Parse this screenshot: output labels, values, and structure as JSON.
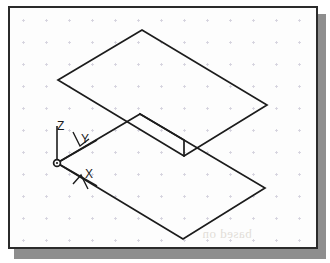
{
  "figure": {
    "name": "isometric-sketch",
    "caption_visible": false,
    "background_color": "#fdfdfd",
    "border_color": "#2b2b2b",
    "shadow_color": "#8e8e8e",
    "line_color": "#1c1c1c",
    "grid_color": "#d8d5e0"
  },
  "grid": {
    "type": "dot-cross",
    "spacing_x": 23,
    "spacing_y": 22,
    "offset_x": 12,
    "offset_y": 11,
    "mark_size": 3
  },
  "axis_indicator": {
    "origin": {
      "x": 47,
      "y": 155
    },
    "origin_marker": "circle",
    "labels": [
      {
        "id": "z-axis-label",
        "text": "Z",
        "x": 47,
        "y": 112
      },
      {
        "id": "y-axis-label",
        "text": "Y",
        "x": 71,
        "y": 125
      },
      {
        "id": "x-axis-label",
        "text": "X",
        "x": 75,
        "y": 160
      }
    ],
    "arms": [
      {
        "id": "z-axis-arm",
        "from": [
          47,
          155
        ],
        "to": [
          47,
          118
        ]
      },
      {
        "id": "y-axis-arm",
        "from": [
          47,
          155
        ],
        "to": [
          85,
          133
        ]
      },
      {
        "id": "x-axis-arm",
        "from": [
          47,
          155
        ],
        "to": [
          85,
          177
        ]
      }
    ],
    "tick_marks": [
      {
        "id": "y-arrow",
        "points": "74,122 80,136 90,130"
      },
      {
        "id": "x-arrow",
        "points": "74,176 82,168 88,180"
      }
    ]
  },
  "geometry": {
    "description": "Two offset parallelogram plates joined by a stepped notch, drawn in isometric projection",
    "upper_plate": {
      "id": "upper-parallelogram",
      "points": "48,72 132,22 257,97 174,148"
    },
    "lower_plate": {
      "id": "lower-parallelogram",
      "points": "47,155 130,106 255,180 173,231"
    },
    "notch": {
      "id": "notch-step",
      "points": "130,106 174,132 174,148"
    }
  },
  "artifacts": {
    "bleed_text": "based on"
  }
}
